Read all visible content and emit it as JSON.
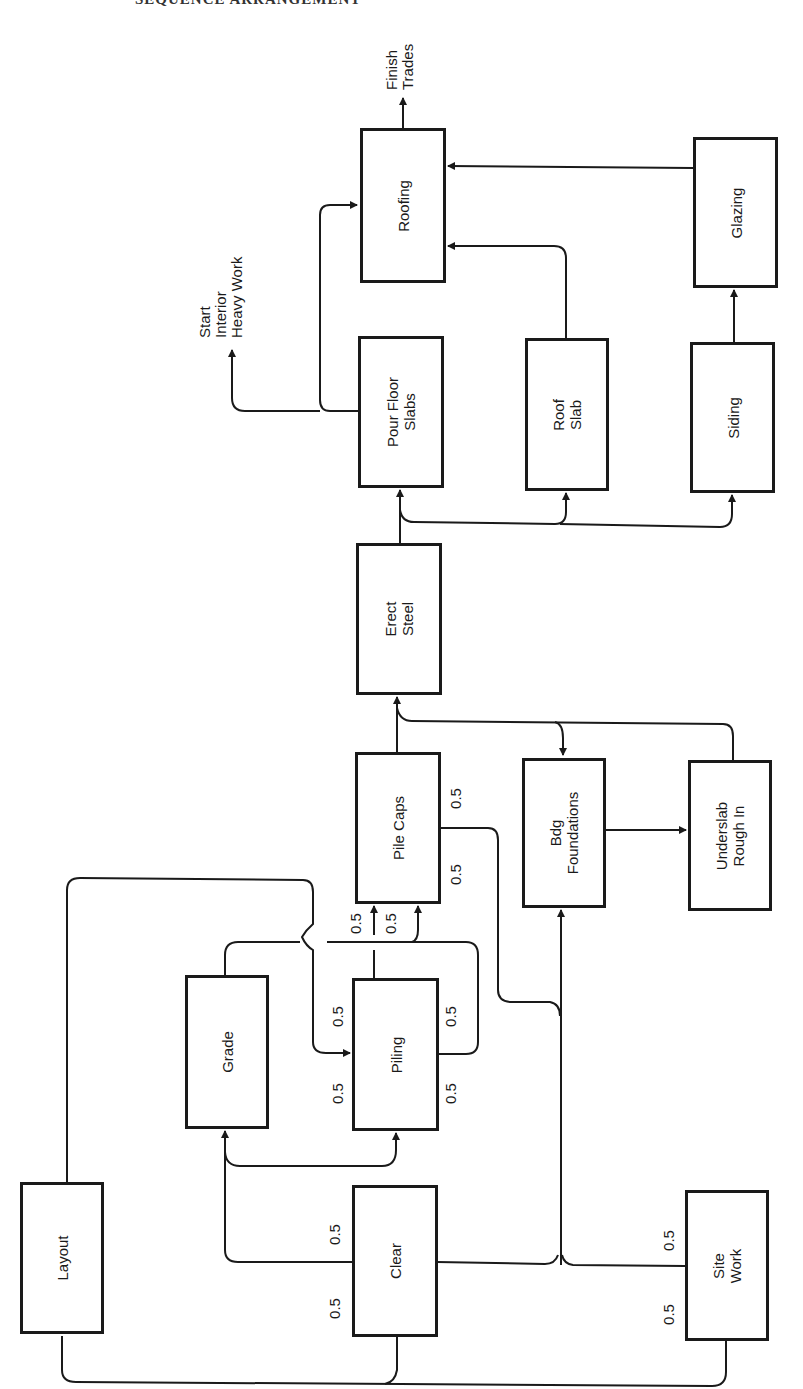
{
  "header": {
    "clipped_title": "SEQUENCE ARRANGEMENT"
  },
  "nodes": {
    "layout": {
      "label": "Layout"
    },
    "clear": {
      "label": "Clear"
    },
    "site_work": {
      "label": "Site\nWork"
    },
    "grade": {
      "label": "Grade"
    },
    "piling": {
      "label": "Piling"
    },
    "pile_caps": {
      "label": "Pile Caps"
    },
    "bdg_foundations": {
      "label": "Bdg\nFoundations"
    },
    "underslab": {
      "label": "Underslab\nRough In"
    },
    "erect_steel": {
      "label": "Erect\nSteel"
    },
    "pour_floor_slabs": {
      "label": "Pour Floor\nSlabs"
    },
    "roof_slab": {
      "label": "Roof\nSlab"
    },
    "siding": {
      "label": "Siding"
    },
    "roofing": {
      "label": "Roofing"
    },
    "glazing": {
      "label": "Glazing"
    }
  },
  "outputs": {
    "finish_trades": "Finish\nTrades",
    "start_interior": "Start\nInterior\nHeavy Work"
  },
  "weights": {
    "clear_top": "0.5",
    "clear_bottom": "0.5",
    "site_work_top": "0.5",
    "site_work_bottom": "0.5",
    "piling_left_top": "0.5",
    "piling_left_bottom": "0.5",
    "piling_right_top": "0.5",
    "piling_right_bottom": "0.5",
    "pile_caps_in_left": "0.5",
    "pile_caps_in_right": "0.5",
    "pile_caps_out_top": "0.5",
    "pile_caps_out_bottom": "0.5"
  },
  "edges": [
    [
      "Layout",
      "Piling"
    ],
    [
      "Layout",
      "Clear"
    ],
    [
      "Site Work",
      "Clear"
    ],
    [
      "Clear",
      "Grade"
    ],
    [
      "Clear",
      "Piling"
    ],
    [
      "Clear",
      "Bdg Foundations"
    ],
    [
      "Site Work",
      "Bdg Foundations"
    ],
    [
      "Grade",
      "Pile Caps"
    ],
    [
      "Piling",
      "Pile Caps"
    ],
    [
      "Pile Caps",
      "Bdg Foundations"
    ],
    [
      "Pile Caps",
      "Erect Steel"
    ],
    [
      "Bdg Foundations",
      "Underslab Rough In"
    ],
    [
      "Bdg Foundations",
      "Erect Steel"
    ],
    [
      "Underslab Rough In",
      "Erect Steel"
    ],
    [
      "Erect Steel",
      "Pour Floor Slabs"
    ],
    [
      "Erect Steel",
      "Roof Slab"
    ],
    [
      "Erect Steel",
      "Siding"
    ],
    [
      "Pour Floor Slabs",
      "Roofing"
    ],
    [
      "Pour Floor Slabs",
      "Start Interior Heavy Work"
    ],
    [
      "Roof Slab",
      "Roofing"
    ],
    [
      "Siding",
      "Glazing"
    ],
    [
      "Glazing",
      "Roofing"
    ],
    [
      "Roofing",
      "Finish Trades"
    ]
  ]
}
